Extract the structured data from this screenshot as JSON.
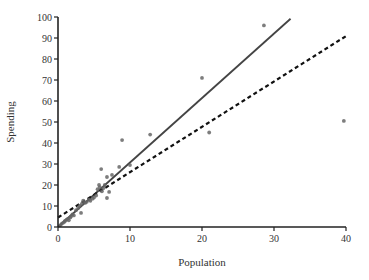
{
  "chart_data": {
    "type": "scatter",
    "title": "",
    "xlabel": "Population",
    "ylabel": "Spending",
    "xlim": [
      0,
      40
    ],
    "ylim": [
      0,
      100
    ],
    "x_ticks": [
      0,
      10,
      20,
      30,
      40
    ],
    "y_ticks": [
      0,
      10,
      20,
      30,
      40,
      50,
      60,
      70,
      80,
      90,
      100
    ],
    "grid": false,
    "legend": null,
    "series": [
      {
        "name": "points",
        "kind": "scatter",
        "color": "#666666",
        "points": [
          [
            0.3,
            0.8
          ],
          [
            0.5,
            1.5
          ],
          [
            0.7,
            2.0
          ],
          [
            0.9,
            2.5
          ],
          [
            1.0,
            3.0
          ],
          [
            1.2,
            3.5
          ],
          [
            1.4,
            4.0
          ],
          [
            1.5,
            3.2
          ],
          [
            1.7,
            4.5
          ],
          [
            1.8,
            5.0
          ],
          [
            2.0,
            6.0
          ],
          [
            2.2,
            5.5
          ],
          [
            2.5,
            8.0
          ],
          [
            2.8,
            9.0
          ],
          [
            3.0,
            10.0
          ],
          [
            3.2,
            6.7
          ],
          [
            3.3,
            11.0
          ],
          [
            3.5,
            12.5
          ],
          [
            3.8,
            11.5
          ],
          [
            4.0,
            12.0
          ],
          [
            4.3,
            13.0
          ],
          [
            4.5,
            12.5
          ],
          [
            5.0,
            14.0
          ],
          [
            4.8,
            13.5
          ],
          [
            5.3,
            15.0
          ],
          [
            5.5,
            18.0
          ],
          [
            5.7,
            20.0
          ],
          [
            5.8,
            19.0
          ],
          [
            6.0,
            27.6
          ],
          [
            6.1,
            17.0
          ],
          [
            6.3,
            18.5
          ],
          [
            6.5,
            20.0
          ],
          [
            6.8,
            23.8
          ],
          [
            6.8,
            13.8
          ],
          [
            7.1,
            16.7
          ],
          [
            7.5,
            24.8
          ],
          [
            8.5,
            28.6
          ],
          [
            8.9,
            41.4
          ],
          [
            10.0,
            29.5
          ],
          [
            12.8,
            44.0
          ],
          [
            20.0,
            71.0
          ],
          [
            21.0,
            45.0
          ],
          [
            28.6,
            96.0
          ],
          [
            39.7,
            50.5
          ]
        ]
      },
      {
        "name": "solid fit",
        "kind": "line",
        "style": "solid",
        "color": "#444444",
        "intercept": 0,
        "slope": 3.07,
        "x_range": [
          0,
          32.3
        ]
      },
      {
        "name": "dashed fit",
        "kind": "line",
        "style": "dashed",
        "color": "#111111",
        "intercept": 4.5,
        "slope": 2.16,
        "x_range": [
          0,
          40
        ]
      }
    ]
  },
  "layout": {
    "plot_left": 58,
    "plot_right": 346,
    "plot_top": 17,
    "plot_bottom": 227
  }
}
